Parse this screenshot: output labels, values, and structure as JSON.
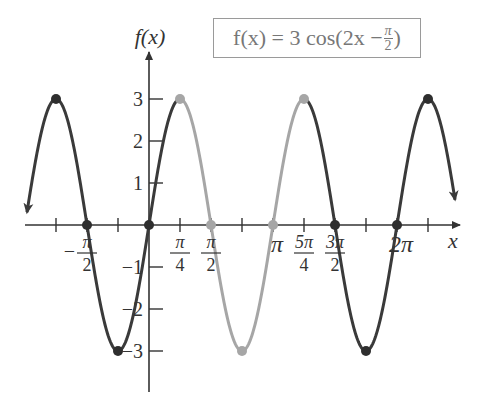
{
  "chart_data": {
    "type": "line",
    "legend": {
      "text_prefix": "f(x) = 3 cos(2x − ",
      "frac_num": "π",
      "frac_den": "2",
      "text_suffix": ")"
    },
    "xlabel": "x",
    "ylabel": "f(x)",
    "function": "3*cos(2x - pi/2)",
    "amplitude": 3,
    "period": "π",
    "xlim": [
      "-π",
      "5π/2"
    ],
    "ylim": [
      -4,
      4
    ],
    "y_ticks": [
      {
        "value": 3,
        "label": "3"
      },
      {
        "value": 2,
        "label": "2"
      },
      {
        "value": 1,
        "label": "1"
      },
      {
        "value": -1,
        "label": "−1"
      },
      {
        "value": -2,
        "label": "−2"
      },
      {
        "value": -3,
        "label": "−3"
      }
    ],
    "x_tick_labels": [
      {
        "x": "-π/2",
        "label": "−π/2"
      },
      {
        "x": "π/4",
        "label": "π/4"
      },
      {
        "x": "π/2",
        "label": "π/2"
      },
      {
        "x": "π",
        "label": "π"
      },
      {
        "x": "5π/4",
        "label": "5π/4"
      },
      {
        "x": "3π/2",
        "label": "3π/2"
      },
      {
        "x": "2π",
        "label": "2π"
      }
    ],
    "x_ticks": [
      "-3π/4",
      "-π/2",
      "-π/4",
      "0",
      "π/4",
      "π/2",
      "3π/4",
      "π",
      "5π/4",
      "3π/2",
      "7π/4",
      "2π",
      "9π/4"
    ],
    "key_points": [
      {
        "x": "-3π/4",
        "y": 3,
        "highlight": false
      },
      {
        "x": "-π/2",
        "y": 0,
        "highlight": false
      },
      {
        "x": "-π/4",
        "y": -3,
        "highlight": false
      },
      {
        "x": "0",
        "y": 0,
        "highlight": false
      },
      {
        "x": "π/4",
        "y": 3,
        "highlight": true
      },
      {
        "x": "π/2",
        "y": 0,
        "highlight": true
      },
      {
        "x": "3π/4",
        "y": -3,
        "highlight": true
      },
      {
        "x": "π",
        "y": 0,
        "highlight": true
      },
      {
        "x": "5π/4",
        "y": 3,
        "highlight": true
      },
      {
        "x": "3π/2",
        "y": 0,
        "highlight": false
      },
      {
        "x": "7π/4",
        "y": -3,
        "highlight": false
      },
      {
        "x": "2π",
        "y": 0,
        "highlight": false
      },
      {
        "x": "9π/4",
        "y": 3,
        "highlight": false
      }
    ],
    "highlighted_period": [
      "π/4",
      "5π/4"
    ],
    "colors": {
      "curve": "#3a3a3a",
      "highlight": "#a6a6a6",
      "axis": "#333333"
    },
    "grid": false
  }
}
